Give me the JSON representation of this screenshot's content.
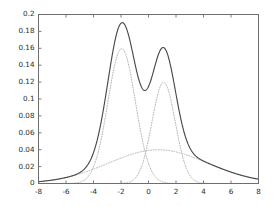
{
  "chart_data": {
    "type": "line",
    "title": "",
    "xlabel": "",
    "ylabel": "",
    "xlim": [
      -8,
      8
    ],
    "ylim": [
      0,
      0.2
    ],
    "grid": false,
    "legend": null,
    "xticks": [
      -8,
      -6,
      -4,
      -2,
      0,
      2,
      4,
      6,
      8
    ],
    "xtick_labels": [
      "-8",
      "-6",
      "-4",
      "-2",
      "0",
      "2",
      "4",
      "6",
      "8"
    ],
    "yticks": [
      0,
      0.02,
      0.04,
      0.06,
      0.08,
      0.1,
      0.12,
      0.14,
      0.16,
      0.18,
      0.2
    ],
    "ytick_labels": [
      "0",
      "0.02",
      "0.04",
      "0.06",
      "0.08",
      "0.1",
      "0.12",
      "0.14",
      "0.16",
      "0.18",
      "0.2"
    ],
    "colors": {
      "mixture": "#4a4a4a",
      "component": "#b0b0b0",
      "axis": "#6e6e6e"
    },
    "series": [
      {
        "name": "mixture-density",
        "style": "solid",
        "color": "#4a4a4a",
        "peaks": [
          {
            "x": -1.9,
            "y": 0.186
          },
          {
            "x": 1.1,
            "y": 0.16
          }
        ],
        "valley": {
          "x": -0.4,
          "y": 0.124
        }
      },
      {
        "name": "component-1",
        "style": "dotted",
        "color": "#b0b0b0",
        "kind": "gaussian",
        "mean": -1.95,
        "sigma": 1.0,
        "weight": 0.4,
        "peak_y": 0.159
      },
      {
        "name": "component-2",
        "style": "dotted",
        "color": "#b0b0b0",
        "kind": "gaussian",
        "mean": 1.1,
        "sigma": 0.85,
        "weight": 0.255,
        "peak_y": 0.12
      },
      {
        "name": "component-3",
        "style": "dotted",
        "color": "#b0b0b0",
        "kind": "gaussian",
        "mean": 0.7,
        "sigma": 3.6,
        "weight": 0.36,
        "peak_y": 0.04
      }
    ],
    "x": [
      -8,
      -7.5,
      -7,
      -6.5,
      -6,
      -5.5,
      -5,
      -4.5,
      -4,
      -3.5,
      -3,
      -2.5,
      -2,
      -1.5,
      -1,
      -0.5,
      0,
      0.5,
      1,
      1.5,
      2,
      2.5,
      3,
      3.5,
      4,
      4.5,
      5,
      5.5,
      6,
      6.5,
      7,
      7.5,
      8
    ],
    "values_mixture": [
      0.004,
      0.006,
      0.008,
      0.012,
      0.018,
      0.026,
      0.038,
      0.056,
      0.08,
      0.11,
      0.145,
      0.172,
      0.186,
      0.18,
      0.152,
      0.128,
      0.124,
      0.142,
      0.16,
      0.152,
      0.118,
      0.08,
      0.056,
      0.044,
      0.036,
      0.03,
      0.024,
      0.019,
      0.014,
      0.011,
      0.008,
      0.006,
      0.004
    ]
  }
}
